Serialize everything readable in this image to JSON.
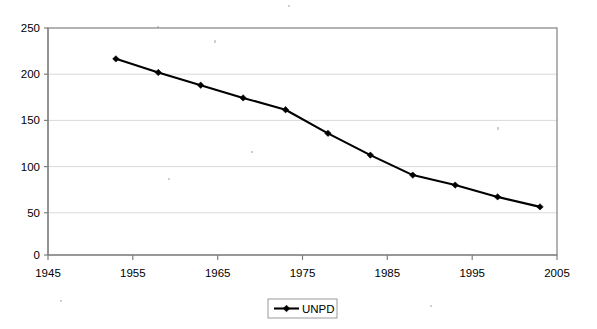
{
  "chart_data": {
    "type": "line",
    "title": "",
    "subtitle": "",
    "xlabel": "",
    "ylabel": "",
    "xlim": [
      1945,
      2005
    ],
    "ylim": [
      0,
      250
    ],
    "grid": true,
    "grid_axis": "y",
    "legend_position": "bottom-center",
    "x": [
      1953,
      1958,
      1963,
      1968,
      1973,
      1978,
      1983,
      1988,
      1993,
      1998,
      2003
    ],
    "xticks": [
      1945,
      1955,
      1965,
      1975,
      1985,
      1995,
      2005
    ],
    "xtick_labels": [
      "1945",
      "1955",
      "1965",
      "1975",
      "1985",
      "1995",
      "2005"
    ],
    "yticks": [
      0,
      50,
      100,
      150,
      200,
      250
    ],
    "ytick_labels": [
      "0",
      "50",
      "100",
      "150",
      "200",
      "250"
    ],
    "series": [
      {
        "name": "UNPD",
        "color": "#000000",
        "marker": "diamond",
        "values": [
          216,
          201,
          187,
          173,
          160,
          134,
          110,
          88,
          77,
          64,
          53
        ]
      }
    ],
    "legend": [
      {
        "label": "UNPD"
      }
    ],
    "annotations": []
  },
  "legend": {
    "entry_label": "UNPD"
  },
  "axes": {
    "y_labels": [
      "250",
      "200",
      "150",
      "100",
      "50",
      "0"
    ],
    "x_labels": [
      "1945",
      "1955",
      "1965",
      "1975",
      "1985",
      "1995",
      "2005"
    ]
  }
}
